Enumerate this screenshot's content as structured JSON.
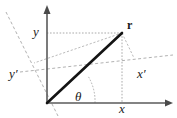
{
  "figure": {
    "kind": "coordinate-rotation-diagram",
    "width": 177,
    "height": 118,
    "background_color": "#ffffff",
    "axis_color": "#4d4d4d",
    "vector_color": "#111111",
    "guide_color": "#9a9a9a",
    "rotated_axis_color": "#a5a5a5",
    "labels": {
      "y": "y",
      "y_prime": "y′",
      "x": "x",
      "x_prime": "x′",
      "r": "r",
      "theta": "θ"
    },
    "geometry": {
      "origin": [
        47,
        103
      ],
      "point_r": [
        122,
        33
      ],
      "x_axis_end": [
        172,
        103
      ],
      "y_axis_top": [
        47,
        6
      ],
      "x_projection_foot": [
        122,
        103
      ],
      "y_projection_foot": [
        47,
        33
      ],
      "xprime_axis_start": [
        20,
        72
      ],
      "xprime_axis_end": [
        173,
        55
      ],
      "yprime_axis_start": [
        6,
        12
      ],
      "yprime_axis_end": [
        58,
        116
      ],
      "xprime_foot": [
        134,
        58
      ]
    }
  }
}
